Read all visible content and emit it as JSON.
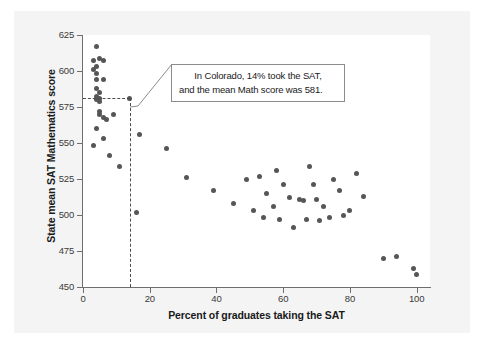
{
  "chart_data": {
    "type": "scatter",
    "title": "",
    "xlabel": "Percent of graduates taking the SAT",
    "ylabel": "State mean SAT Mathematics score",
    "xlim": [
      0,
      104
    ],
    "ylim": [
      450,
      625
    ],
    "xticks": [
      0,
      20,
      40,
      60,
      80,
      100
    ],
    "yticks": [
      450,
      475,
      500,
      525,
      550,
      575,
      600,
      625
    ],
    "grid": false,
    "legend": null,
    "point_color": "#565656",
    "axis_color": "#6e6e6e",
    "annotation": {
      "line1": "In Colorado, 14% took the SAT,",
      "line2": "and the mean Math score was 581.",
      "target_x": 14,
      "target_y": 581,
      "reference_lines": "dashed"
    },
    "points": [
      {
        "x": 4,
        "y": 617
      },
      {
        "x": 3,
        "y": 607
      },
      {
        "x": 5,
        "y": 609
      },
      {
        "x": 6,
        "y": 607
      },
      {
        "x": 3,
        "y": 601
      },
      {
        "x": 4,
        "y": 598
      },
      {
        "x": 4,
        "y": 603
      },
      {
        "x": 4,
        "y": 594
      },
      {
        "x": 6,
        "y": 594
      },
      {
        "x": 4,
        "y": 588
      },
      {
        "x": 5,
        "y": 585
      },
      {
        "x": 4,
        "y": 582
      },
      {
        "x": 5,
        "y": 581
      },
      {
        "x": 4,
        "y": 580
      },
      {
        "x": 5,
        "y": 579
      },
      {
        "x": 14,
        "y": 581
      },
      {
        "x": 5,
        "y": 572
      },
      {
        "x": 5,
        "y": 570
      },
      {
        "x": 6,
        "y": 568
      },
      {
        "x": 7,
        "y": 566
      },
      {
        "x": 9,
        "y": 570
      },
      {
        "x": 4,
        "y": 560
      },
      {
        "x": 6,
        "y": 553
      },
      {
        "x": 3,
        "y": 548
      },
      {
        "x": 8,
        "y": 541
      },
      {
        "x": 11,
        "y": 534
      },
      {
        "x": 17,
        "y": 556
      },
      {
        "x": 16,
        "y": 502
      },
      {
        "x": 25,
        "y": 546
      },
      {
        "x": 31,
        "y": 526
      },
      {
        "x": 39,
        "y": 517
      },
      {
        "x": 45,
        "y": 508
      },
      {
        "x": 49,
        "y": 525
      },
      {
        "x": 51,
        "y": 503
      },
      {
        "x": 53,
        "y": 527
      },
      {
        "x": 54,
        "y": 498
      },
      {
        "x": 55,
        "y": 515
      },
      {
        "x": 57,
        "y": 506
      },
      {
        "x": 58,
        "y": 531
      },
      {
        "x": 59,
        "y": 497
      },
      {
        "x": 60,
        "y": 521
      },
      {
        "x": 62,
        "y": 512
      },
      {
        "x": 63,
        "y": 491
      },
      {
        "x": 65,
        "y": 511
      },
      {
        "x": 66,
        "y": 510
      },
      {
        "x": 67,
        "y": 497
      },
      {
        "x": 68,
        "y": 534
      },
      {
        "x": 69,
        "y": 521
      },
      {
        "x": 70,
        "y": 511
      },
      {
        "x": 71,
        "y": 496
      },
      {
        "x": 72,
        "y": 506
      },
      {
        "x": 74,
        "y": 498
      },
      {
        "x": 75,
        "y": 525
      },
      {
        "x": 77,
        "y": 517
      },
      {
        "x": 78,
        "y": 500
      },
      {
        "x": 80,
        "y": 503
      },
      {
        "x": 82,
        "y": 529
      },
      {
        "x": 84,
        "y": 513
      },
      {
        "x": 90,
        "y": 470
      },
      {
        "x": 94,
        "y": 471
      },
      {
        "x": 99,
        "y": 463
      },
      {
        "x": 100,
        "y": 459
      }
    ]
  }
}
